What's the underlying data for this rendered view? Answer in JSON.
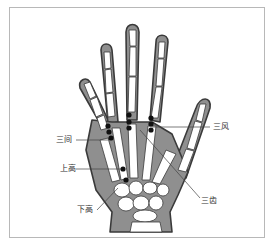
{
  "figure": {
    "labels": {
      "san_jian": "三间",
      "san_feng": "三风",
      "shang_gao": "上高",
      "xia_gao": "下高",
      "san_chi": "三齿"
    },
    "colors": {
      "skin": "#8a8a8a",
      "bone": "#ffffff",
      "outline": "#3a3a3a",
      "point": "#111111",
      "frame": "#b8b8b8"
    }
  }
}
